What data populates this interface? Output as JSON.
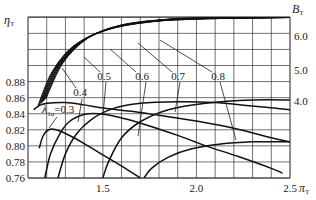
{
  "chart_data": {
    "type": "line",
    "title": "",
    "xlabel": "π_T",
    "ylabel_left": "η_T",
    "ylabel_right": "B_T",
    "xlim": [
      1.1,
      2.5
    ],
    "ylim_left": [
      0.76,
      0.9675
    ],
    "grid": true,
    "x_step": 0.1,
    "y_step": 0.02,
    "x_ticks": [
      {
        "v": 1.5,
        "label": "1.5"
      },
      {
        "v": 2.0,
        "label": "2.0"
      },
      {
        "v": 2.5,
        "label": "2.5"
      }
    ],
    "y_ticks_left": [
      {
        "v": 0.76,
        "label": "0.76"
      },
      {
        "v": 0.78,
        "label": "0.78"
      },
      {
        "v": 0.8,
        "label": "0.80"
      },
      {
        "v": 0.82,
        "label": "0.82"
      },
      {
        "v": 0.84,
        "label": "0.84"
      },
      {
        "v": 0.86,
        "label": "0.86"
      },
      {
        "v": 0.88,
        "label": "0.88"
      }
    ],
    "y_ticks_right": [
      {
        "y": 36,
        "label": "6.0"
      },
      {
        "y": 70,
        "label": "5.0"
      },
      {
        "y": 101,
        "label": "4.0"
      }
    ],
    "efficiency_series": [
      {
        "name": "λ1u=0.3",
        "points": [
          [
            1.16,
            0.797
          ],
          [
            1.18,
            0.812
          ],
          [
            1.21,
            0.82
          ],
          [
            1.25,
            0.82
          ],
          [
            1.33,
            0.812
          ],
          [
            1.42,
            0.8
          ],
          [
            1.52,
            0.786
          ],
          [
            1.62,
            0.772
          ],
          [
            1.7,
            0.76
          ]
        ]
      },
      {
        "name": "λ1u=0.4",
        "points": [
          [
            1.19,
            0.76
          ],
          [
            1.22,
            0.79
          ],
          [
            1.27,
            0.815
          ],
          [
            1.32,
            0.83
          ],
          [
            1.4,
            0.839
          ],
          [
            1.48,
            0.84
          ],
          [
            1.58,
            0.836
          ],
          [
            1.72,
            0.827
          ],
          [
            1.9,
            0.813
          ],
          [
            2.05,
            0.8
          ],
          [
            2.22,
            0.787
          ],
          [
            2.4,
            0.772
          ],
          [
            2.46,
            0.766
          ]
        ]
      },
      {
        "name": "λ1u=0.5",
        "points": [
          [
            1.26,
            0.76
          ],
          [
            1.3,
            0.79
          ],
          [
            1.36,
            0.815
          ],
          [
            1.44,
            0.833
          ],
          [
            1.55,
            0.846
          ],
          [
            1.7,
            0.853
          ],
          [
            1.9,
            0.855
          ],
          [
            2.1,
            0.854
          ],
          [
            2.28,
            0.85
          ],
          [
            2.5,
            0.845
          ]
        ]
      },
      {
        "name": "λ1u=0.6",
        "points": [
          [
            1.5,
            0.76
          ],
          [
            1.53,
            0.78
          ],
          [
            1.6,
            0.81
          ],
          [
            1.7,
            0.83
          ],
          [
            1.85,
            0.845
          ],
          [
            2.05,
            0.853
          ],
          [
            2.3,
            0.857
          ],
          [
            2.5,
            0.857
          ]
        ]
      },
      {
        "name": "λ1u=0.7",
        "points": [
          [
            1.13,
            0.845
          ],
          [
            1.16,
            0.85
          ],
          [
            1.2,
            0.853
          ],
          [
            1.3,
            0.854
          ],
          [
            1.4,
            0.851
          ],
          [
            1.5,
            0.847
          ],
          [
            1.65,
            0.843
          ],
          [
            1.8,
            0.838
          ],
          [
            2.0,
            0.831
          ],
          [
            2.2,
            0.822
          ],
          [
            2.4,
            0.81
          ],
          [
            2.5,
            0.805
          ]
        ]
      },
      {
        "name": "λ1u=0.8",
        "points": [
          [
            1.72,
            0.76
          ],
          [
            1.76,
            0.772
          ],
          [
            1.85,
            0.786
          ],
          [
            1.97,
            0.796
          ],
          [
            2.12,
            0.802
          ],
          [
            2.3,
            0.805
          ],
          [
            2.5,
            0.805
          ]
        ]
      }
    ],
    "b_series": [
      {
        "offset": 0
      },
      {
        "offset": 1
      },
      {
        "offset": 2
      },
      {
        "offset": 3
      },
      {
        "offset": 4
      },
      {
        "offset": 5
      },
      {
        "offset": 6
      }
    ],
    "b_annotations": [
      {
        "label": "0.4",
        "tx": 80,
        "ty": 96,
        "lx1": 62,
        "ly1": 68,
        "lx2": 76,
        "ly2": 88
      },
      {
        "label": "0.5",
        "tx": 104,
        "ty": 80,
        "lx1": 84,
        "ly1": 57,
        "lx2": 100,
        "ly2": 72
      },
      {
        "label": "0.6",
        "tx": 142,
        "ty": 80,
        "lx1": 110,
        "ly1": 49,
        "lx2": 136,
        "ly2": 72
      },
      {
        "label": "0.7",
        "tx": 178,
        "ty": 80,
        "lx1": 138,
        "ly1": 43,
        "lx2": 172,
        "ly2": 72
      },
      {
        "label": "0.8",
        "tx": 218,
        "ty": 80,
        "lx1": 160,
        "ly1": 40,
        "lx2": 212,
        "ly2": 72
      }
    ],
    "lambda_label": {
      "prefix": "λ",
      "sub": "1u",
      "suffix": "=0.3"
    }
  }
}
